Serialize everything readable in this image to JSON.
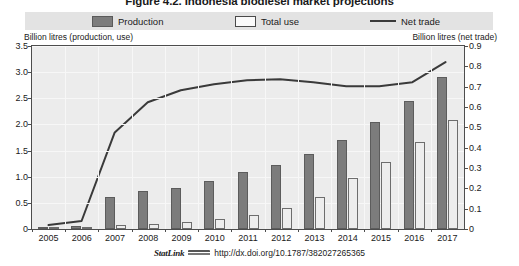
{
  "figure": {
    "title": "Figure 4.2. Indonesia biodiesel market projections",
    "footer": {
      "statlink_label": "StatLink",
      "statlink_icon": "statlink-icon",
      "url": "http://dx.doi.org/10.1787/382027265365"
    }
  },
  "legend": {
    "items": [
      {
        "label": "Production",
        "swatch": "filled-dark-rect",
        "color": "#7c7c7c"
      },
      {
        "label": "Total use",
        "swatch": "outlined-light-rect",
        "color": "#fafafa"
      },
      {
        "label": "Net trade",
        "swatch": "solid-line",
        "color": "#3a3a3a"
      }
    ]
  },
  "chart_data": {
    "type": "bar",
    "title": "Figure 4.2. Indonesia biodiesel market projections",
    "xlabel": "",
    "ylabel": "Billion litres (production, use)",
    "y2label": "Billion litres (net trade)",
    "categories": [
      "2005",
      "2006",
      "2007",
      "2008",
      "2009",
      "2010",
      "2011",
      "2012",
      "2013",
      "2014",
      "2015",
      "2016",
      "2017"
    ],
    "ylim": [
      0,
      3.5
    ],
    "yticks": [
      "0",
      "0.5",
      "1.0",
      "1.5",
      "2.0",
      "2.5",
      "3.0",
      "3.5"
    ],
    "y2lim": [
      0,
      0.9
    ],
    "y2ticks": [
      "0",
      "0.1",
      "0.2",
      "0.3",
      "0.4",
      "0.5",
      "0.6",
      "0.7",
      "0.8",
      "0.9"
    ],
    "grid": true,
    "legend_position": "top",
    "series": [
      {
        "name": "Production",
        "axis": "left",
        "type": "bar",
        "color": "#7c7c7c",
        "values": [
          0.02,
          0.06,
          0.62,
          0.72,
          0.79,
          0.91,
          1.1,
          1.22,
          1.43,
          1.7,
          2.05,
          2.44,
          2.9
        ]
      },
      {
        "name": "Total use",
        "axis": "left",
        "type": "bar",
        "color": "#ededed",
        "values": [
          0.01,
          0.03,
          0.07,
          0.1,
          0.13,
          0.19,
          0.27,
          0.41,
          0.61,
          0.97,
          1.29,
          1.66,
          2.09
        ]
      },
      {
        "name": "Net trade",
        "axis": "right",
        "type": "line",
        "color": "#3a3a3a",
        "values": [
          0.01,
          0.03,
          0.47,
          0.62,
          0.68,
          0.71,
          0.73,
          0.735,
          0.72,
          0.7,
          0.7,
          0.72,
          0.82
        ]
      }
    ]
  }
}
